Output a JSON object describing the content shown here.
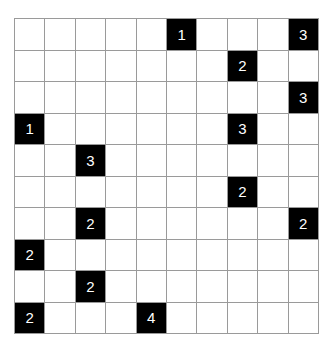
{
  "puzzle": {
    "rows": 10,
    "cols": 10,
    "colors": {
      "grid_line": "#9a9a9a",
      "empty": "#ffffff",
      "block": "#000000",
      "number": "#ffffff"
    },
    "clues": [
      {
        "row": 0,
        "col": 5,
        "value": "1"
      },
      {
        "row": 0,
        "col": 9,
        "value": "3"
      },
      {
        "row": 1,
        "col": 7,
        "value": "2"
      },
      {
        "row": 2,
        "col": 9,
        "value": "3"
      },
      {
        "row": 3,
        "col": 0,
        "value": "1"
      },
      {
        "row": 3,
        "col": 7,
        "value": "3"
      },
      {
        "row": 4,
        "col": 2,
        "value": "3"
      },
      {
        "row": 5,
        "col": 7,
        "value": "2"
      },
      {
        "row": 6,
        "col": 2,
        "value": "2"
      },
      {
        "row": 6,
        "col": 9,
        "value": "2"
      },
      {
        "row": 7,
        "col": 0,
        "value": "2"
      },
      {
        "row": 8,
        "col": 2,
        "value": "2"
      },
      {
        "row": 9,
        "col": 0,
        "value": "2"
      },
      {
        "row": 9,
        "col": 4,
        "value": "4"
      }
    ]
  }
}
